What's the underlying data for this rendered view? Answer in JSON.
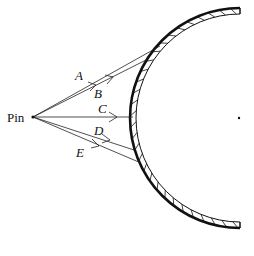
{
  "diagram": {
    "pin_label": "Pin",
    "rays": [
      {
        "label": "A"
      },
      {
        "label": "B"
      },
      {
        "label": "C"
      },
      {
        "label": "D"
      },
      {
        "label": "E"
      }
    ],
    "colors": {
      "ink": "#111111",
      "background": "#ffffff"
    }
  }
}
